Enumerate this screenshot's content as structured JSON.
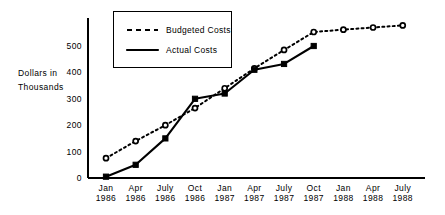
{
  "chart_data": {
    "type": "line",
    "title": "",
    "xlabel": "",
    "ylabel": "Dollars in Thousands",
    "ylabel_lines": [
      "Dollars in",
      "Thousands"
    ],
    "categories": [
      "Jan 1986",
      "Apr 1986",
      "July 1986",
      "Oct 1986",
      "Jan 1987",
      "Apr 1987",
      "July 1987",
      "Oct 1987",
      "Jan 1988",
      "Apr 1988",
      "July 1988"
    ],
    "category_lines": [
      [
        "Jan",
        "1986"
      ],
      [
        "Apr",
        "1986"
      ],
      [
        "July",
        "1986"
      ],
      [
        "Oct",
        "1986"
      ],
      [
        "Jan",
        "1987"
      ],
      [
        "Apr",
        "1987"
      ],
      [
        "July",
        "1987"
      ],
      [
        "Oct",
        "1987"
      ],
      [
        "Jan",
        "1988"
      ],
      [
        "Apr",
        "1988"
      ],
      [
        "July",
        "1988"
      ]
    ],
    "series": [
      {
        "name": "Budgeted Costs",
        "style": "dashed",
        "marker": "open-circle",
        "color": "#000000",
        "values": [
          75,
          140,
          200,
          265,
          340,
          415,
          485,
          553,
          562,
          570,
          578
        ]
      },
      {
        "name": "Actual Costs",
        "style": "solid",
        "marker": "filled-square",
        "color": "#000000",
        "values": [
          5,
          50,
          150,
          300,
          320,
          410,
          432,
          500,
          null,
          null,
          null
        ]
      }
    ],
    "yticks": [
      0,
      100,
      200,
      300,
      400,
      500
    ],
    "ylim": [
      0,
      600
    ],
    "grid": false,
    "legend_position": "top-left-inset"
  },
  "legend": {
    "entries": [
      {
        "label": "Budgeted Costs",
        "style": "dashed"
      },
      {
        "label": "Actual Costs",
        "style": "solid"
      }
    ]
  }
}
